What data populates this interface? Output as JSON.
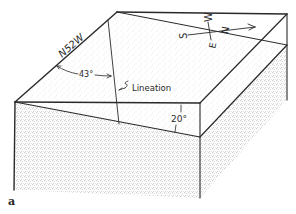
{
  "figure": {
    "label": "a"
  },
  "annotations": {
    "strike": "N52W",
    "pitch_angle": "43°",
    "lineation": "Lineation",
    "dip_angle": "20°"
  },
  "compass": {
    "north": "N",
    "south": "S",
    "east": "E",
    "west": "W"
  },
  "colors": {
    "line": "#2a2a2a",
    "stipple": "#8a8a8a",
    "background": "#ffffff"
  }
}
